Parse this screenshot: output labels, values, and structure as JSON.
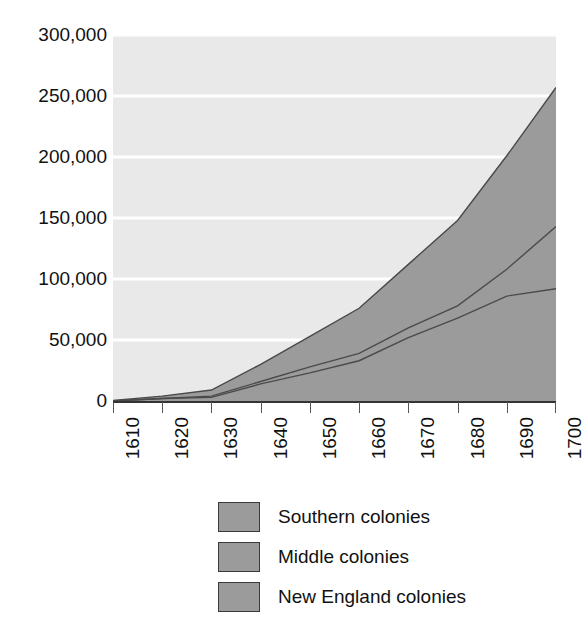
{
  "chart_data": {
    "type": "area",
    "stacked": true,
    "title": "",
    "subtitle": "",
    "xlabel": "",
    "ylabel": "",
    "x": [
      1610,
      1620,
      1630,
      1640,
      1650,
      1660,
      1670,
      1680,
      1690,
      1700
    ],
    "categories": [
      "1610",
      "1620",
      "1630",
      "1640",
      "1650",
      "1660",
      "1670",
      "1680",
      "1690",
      "1700"
    ],
    "xlim": [
      1610,
      1700
    ],
    "ylim": [
      0,
      300000
    ],
    "y_ticks": [
      0,
      50000,
      100000,
      150000,
      200000,
      250000,
      300000
    ],
    "y_tick_labels": [
      "0",
      "50,000",
      "100,000",
      "150,000",
      "200,000",
      "250,000",
      "300,000"
    ],
    "x_ticks": [
      1610,
      1620,
      1630,
      1640,
      1650,
      1660,
      1670,
      1680,
      1690,
      1700
    ],
    "x_tick_labels": [
      "1610",
      "1620",
      "1630",
      "1640",
      "1650",
      "1660",
      "1670",
      "1680",
      "1690",
      "1700"
    ],
    "grid": true,
    "grid_axis": "y",
    "legend_position": "bottom",
    "series": [
      {
        "name": "New England colonies",
        "color": "#9b9b9b",
        "values": [
          0,
          2000,
          3000,
          14000,
          23000,
          33000,
          52000,
          68000,
          86000,
          92000
        ]
      },
      {
        "name": "Middle colonies",
        "color": "#9b9b9b",
        "values": [
          0,
          0,
          1000,
          2000,
          5000,
          6000,
          8000,
          10000,
          22000,
          51000
        ]
      },
      {
        "name": "Southern colonies",
        "color": "#9b9b9b",
        "values": [
          500,
          2000,
          5000,
          14000,
          25000,
          37000,
          52000,
          70000,
          93000,
          114000
        ]
      }
    ],
    "series_order_bottom_to_top": [
      "New England colonies",
      "Middle colonies",
      "Southern colonies"
    ],
    "stack_totals": [
      500,
      4000,
      9000,
      30000,
      53000,
      76000,
      112000,
      148000,
      201000,
      257000
    ]
  },
  "axes": {
    "y_labels": [
      "300,000",
      "250,000",
      "200,000",
      "150,000",
      "100,000",
      "50,000",
      "0"
    ],
    "x_labels": [
      "1610",
      "1620",
      "1630",
      "1640",
      "1650",
      "1660",
      "1670",
      "1680",
      "1690",
      "1700"
    ]
  },
  "legend": {
    "items": [
      {
        "label": "Southern colonies",
        "color": "#9b9b9b"
      },
      {
        "label": "Middle colonies",
        "color": "#9b9b9b"
      },
      {
        "label": "New England colonies",
        "color": "#9b9b9b"
      }
    ]
  },
  "style": {
    "plot_background": "#e9e9e9",
    "gridline_color": "#ffffff",
    "axis_color": "#333333",
    "series_line_color": "#4a4a4a",
    "page_background": "#ffffff"
  }
}
